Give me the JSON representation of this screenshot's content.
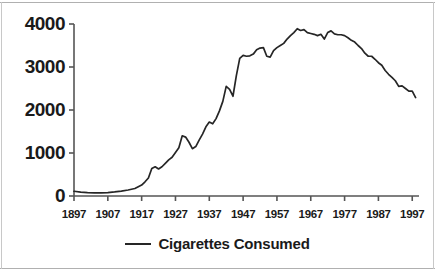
{
  "chart_data": {
    "type": "line",
    "title": "",
    "subtitle": "",
    "xlabel": "",
    "ylabel": "",
    "xlim": [
      1897,
      1999
    ],
    "ylim": [
      0,
      4000
    ],
    "grid": false,
    "legend_position": "bottom-center",
    "y_ticks": [
      "0",
      "1000",
      "2000",
      "3000",
      "4000"
    ],
    "y_tick_values": [
      0,
      1000,
      2000,
      3000,
      4000
    ],
    "x_ticks": [
      "1897",
      "1907",
      "1917",
      "1927",
      "1937",
      "1947",
      "1957",
      "1967",
      "1977",
      "1987",
      "1997"
    ],
    "x_tick_values": [
      1897,
      1907,
      1917,
      1927,
      1937,
      1947,
      1957,
      1967,
      1977,
      1987,
      1997
    ],
    "series": [
      {
        "name": "Cigarettes Consumed",
        "color": "#262626",
        "x": [
          1897,
          1899,
          1901,
          1903,
          1905,
          1907,
          1909,
          1911,
          1913,
          1915,
          1917,
          1918,
          1919,
          1920,
          1921,
          1922,
          1923,
          1924,
          1925,
          1926,
          1927,
          1928,
          1929,
          1930,
          1931,
          1932,
          1933,
          1934,
          1935,
          1936,
          1937,
          1938,
          1939,
          1940,
          1941,
          1942,
          1943,
          1944,
          1945,
          1946,
          1947,
          1948,
          1949,
          1950,
          1951,
          1952,
          1953,
          1954,
          1955,
          1956,
          1957,
          1958,
          1959,
          1960,
          1961,
          1962,
          1963,
          1964,
          1965,
          1966,
          1967,
          1968,
          1969,
          1970,
          1971,
          1972,
          1973,
          1974,
          1975,
          1976,
          1977,
          1978,
          1979,
          1980,
          1981,
          1982,
          1983,
          1984,
          1985,
          1986,
          1987,
          1988,
          1989,
          1990,
          1991,
          1992,
          1993,
          1994,
          1995,
          1996,
          1997,
          1998
        ],
        "y": [
          110,
          90,
          80,
          75,
          75,
          80,
          95,
          115,
          140,
          175,
          255,
          330,
          420,
          640,
          680,
          630,
          680,
          760,
          840,
          900,
          1010,
          1120,
          1400,
          1370,
          1250,
          1100,
          1150,
          1300,
          1440,
          1610,
          1720,
          1680,
          1800,
          1980,
          2200,
          2550,
          2480,
          2320,
          2800,
          3200,
          3270,
          3250,
          3260,
          3300,
          3400,
          3440,
          3450,
          3250,
          3230,
          3380,
          3450,
          3500,
          3550,
          3650,
          3730,
          3800,
          3890,
          3850,
          3870,
          3800,
          3780,
          3760,
          3730,
          3760,
          3650,
          3800,
          3840,
          3770,
          3750,
          3750,
          3730,
          3680,
          3620,
          3580,
          3500,
          3430,
          3320,
          3250,
          3250,
          3180,
          3100,
          3040,
          2920,
          2830,
          2760,
          2680,
          2550,
          2560,
          2500,
          2440,
          2440,
          2290
        ]
      }
    ]
  },
  "legend": {
    "label": "Cigarettes Consumed"
  }
}
